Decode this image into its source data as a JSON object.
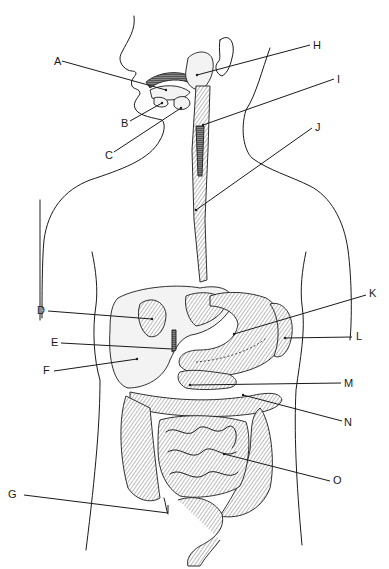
{
  "figure": {
    "labels": [
      {
        "id": "A",
        "text": "A",
        "x": 54,
        "y": 56,
        "target": [
          166,
          90
        ]
      },
      {
        "id": "B",
        "text": "B",
        "x": 121,
        "y": 120,
        "target": [
          162,
          103
        ]
      },
      {
        "id": "C",
        "text": "C",
        "x": 105,
        "y": 151,
        "target": [
          181,
          108
        ]
      },
      {
        "id": "D",
        "text": "D",
        "x": 37,
        "y": 305,
        "target": [
          152,
          319
        ]
      },
      {
        "id": "E",
        "text": "E",
        "x": 51,
        "y": 338,
        "target": [
          172,
          349
        ]
      },
      {
        "id": "F",
        "text": "F",
        "x": 43,
        "y": 366,
        "target": [
          137,
          359
        ]
      },
      {
        "id": "G",
        "text": "G",
        "x": 8,
        "y": 489,
        "target": [
          168,
          513
        ]
      },
      {
        "id": "H",
        "text": "H",
        "x": 313,
        "y": 40,
        "target": [
          197,
          75
        ]
      },
      {
        "id": "I",
        "text": "I",
        "x": 337,
        "y": 74,
        "target": [
          203,
          125
        ]
      },
      {
        "id": "J",
        "text": "J",
        "x": 315,
        "y": 122,
        "target": [
          196,
          210
        ]
      },
      {
        "id": "K",
        "text": "K",
        "x": 370,
        "y": 289,
        "target": [
          234,
          334
        ]
      },
      {
        "id": "L",
        "text": "L",
        "x": 356,
        "y": 332,
        "target": [
          285,
          338
        ]
      },
      {
        "id": "M",
        "text": "M",
        "x": 345,
        "y": 378,
        "target": [
          190,
          385
        ]
      },
      {
        "id": "N",
        "text": "N",
        "x": 344,
        "y": 418,
        "target": [
          243,
          395
        ]
      },
      {
        "id": "O",
        "text": "O",
        "x": 334,
        "y": 475,
        "target": [
          224,
          454
        ]
      }
    ]
  }
}
